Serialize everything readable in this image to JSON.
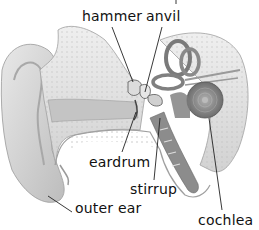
{
  "diagram": {
    "labels": {
      "hammer": "hammer",
      "anvil": "anvil",
      "eardrum": "eardrum",
      "stirrup": "stirrup",
      "outer_ear": "outer ear",
      "cochlea": "cochlea"
    },
    "colors": {
      "background": "#ffffff",
      "text": "#111111",
      "leader_line": "#222222",
      "bone": "#e4e4e4",
      "skin": "#d8d8d8",
      "shadow": "#8a8a8a"
    }
  }
}
